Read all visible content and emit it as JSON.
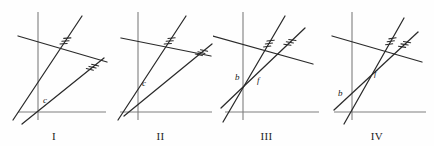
{
  "figure": {
    "type": "geometry-diagram",
    "background_color": "#fefefe",
    "line_color": "#2a2a2a",
    "axis_color": "#7e7e7e",
    "label_color": "#1a1a1a"
  },
  "panels": [
    {
      "id": "panel-1",
      "label": "I",
      "x_offset": 0,
      "width": 108,
      "axes": {
        "y_axis_x": 38,
        "x_axis_y": 112,
        "x_axis_start": 18,
        "x_axis_end": 106,
        "y_axis_top": 12,
        "y_axis_bottom": 120
      },
      "lines": [
        {
          "name": "parallel-line-a",
          "x1": 13,
          "y1": 120,
          "x2": 82,
          "y2": 16,
          "hash_marks": 3,
          "hash_at": 0.76
        },
        {
          "name": "parallel-line-b",
          "x1": 22,
          "y1": 124,
          "x2": 104,
          "y2": 58,
          "hash_marks": 3,
          "hash_at": 0.86
        },
        {
          "name": "transversal",
          "x1": 18,
          "y1": 36,
          "x2": 107,
          "y2": 62,
          "hash_marks": 0,
          "hash_at": 0
        }
      ],
      "points": [
        {
          "name": "point-c",
          "label": "c",
          "x": 43,
          "y": 103
        }
      ]
    },
    {
      "id": "panel-2",
      "label": "II",
      "x_offset": 108,
      "width": 105,
      "axes": {
        "y_axis_x": 30,
        "x_axis_y": 112,
        "x_axis_start": 12,
        "x_axis_end": 104,
        "y_axis_top": 12,
        "y_axis_bottom": 120
      },
      "lines": [
        {
          "name": "parallel-line-a",
          "x1": 10,
          "y1": 120,
          "x2": 78,
          "y2": 16,
          "hash_marks": 3,
          "hash_at": 0.76
        },
        {
          "name": "parallel-line-b",
          "x1": 16,
          "y1": 116,
          "x2": 104,
          "y2": 44,
          "hash_marks": 3,
          "hash_at": 0.88
        },
        {
          "name": "transversal",
          "x1": 13,
          "y1": 38,
          "x2": 103,
          "y2": 56,
          "hash_marks": 0,
          "hash_at": 0
        }
      ],
      "points": [
        {
          "name": "point-c",
          "label": "c",
          "x": 34,
          "y": 86
        }
      ]
    },
    {
      "id": "panel-3",
      "label": "III",
      "x_offset": 213,
      "width": 107,
      "axes": {
        "y_axis_x": 30,
        "x_axis_y": 112,
        "x_axis_start": 12,
        "x_axis_end": 106,
        "y_axis_top": 12,
        "y_axis_bottom": 120
      },
      "lines": [
        {
          "name": "parallel-line-a",
          "x1": 10,
          "y1": 122,
          "x2": 72,
          "y2": 16,
          "hash_marks": 3,
          "hash_at": 0.74
        },
        {
          "name": "parallel-line-b",
          "x1": 8,
          "y1": 108,
          "x2": 92,
          "y2": 28,
          "hash_marks": 3,
          "hash_at": 0.82
        },
        {
          "name": "transversal",
          "x1": 0,
          "y1": 36,
          "x2": 100,
          "y2": 64,
          "hash_marks": 0,
          "hash_at": 0
        }
      ],
      "points": [
        {
          "name": "point-b",
          "label": "b",
          "x": 22,
          "y": 80
        },
        {
          "name": "point-f",
          "label": "f",
          "x": 44,
          "y": 83
        }
      ]
    },
    {
      "id": "panel-4",
      "label": "IV",
      "x_offset": 320,
      "width": 114,
      "axes": {
        "y_axis_x": 32,
        "x_axis_y": 112,
        "x_axis_start": 14,
        "x_axis_end": 106,
        "y_axis_top": 12,
        "y_axis_bottom": 120
      },
      "lines": [
        {
          "name": "parallel-line-a",
          "x1": 24,
          "y1": 124,
          "x2": 84,
          "y2": 18,
          "hash_marks": 3,
          "hash_at": 0.78
        },
        {
          "name": "parallel-line-b",
          "x1": 14,
          "y1": 110,
          "x2": 98,
          "y2": 32,
          "hash_marks": 3,
          "hash_at": 0.84
        },
        {
          "name": "transversal",
          "x1": 12,
          "y1": 36,
          "x2": 102,
          "y2": 62,
          "hash_marks": 0,
          "hash_at": 0
        }
      ],
      "points": [
        {
          "name": "point-b",
          "label": "b",
          "x": 18,
          "y": 96
        },
        {
          "name": "point-f",
          "label": "f",
          "x": 54,
          "y": 76
        }
      ]
    }
  ]
}
